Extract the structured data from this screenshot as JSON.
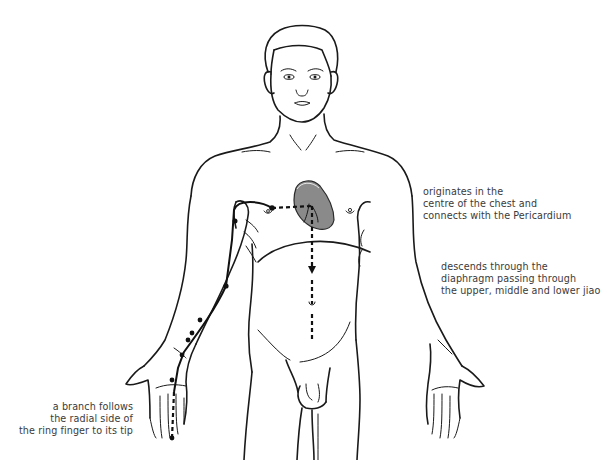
{
  "figure": {
    "colors": {
      "line": "#1a1a1a",
      "organ_fill": "#8a8a8a",
      "organ_outline": "#2a2a2a",
      "text": "#3a3a3a",
      "background": "#ffffff"
    }
  },
  "annotations": [
    {
      "id": "origin",
      "lines": [
        "originates in the",
        "centre of the chest and",
        "connects with the Pericardium"
      ]
    },
    {
      "id": "descent",
      "lines": [
        "descends through the",
        "diaphragm passing through",
        "the upper, middle and lower jiao"
      ]
    },
    {
      "id": "branch",
      "lines": [
        "a branch follows",
        "the radial side of",
        "the ring finger to its tip"
      ]
    }
  ],
  "channel": {
    "organ": "pericardium",
    "points_count": 9
  }
}
